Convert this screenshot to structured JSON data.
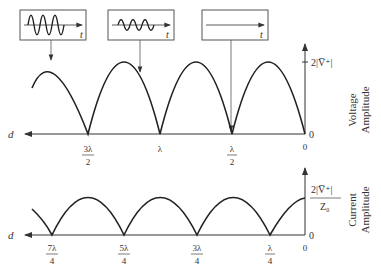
{
  "voltage_plot": {
    "axis_label_d": "d",
    "y_tick_max": "2|V̅⁺|",
    "y_tick_zero": "0",
    "y_title_line1": "Voltage",
    "y_title_line2": "Amplitude",
    "x_ticks": [
      {
        "num": "3λ",
        "den": "2"
      },
      {
        "num": "λ",
        "den": ""
      },
      {
        "num": "λ",
        "den": "2"
      },
      {
        "num": "0",
        "den": ""
      }
    ]
  },
  "current_plot": {
    "axis_label_d": "d",
    "y_tick_max_num": "2|V̅⁺|",
    "y_tick_max_den": "Z₀",
    "y_tick_zero": "0",
    "y_title_line1": "Current",
    "y_title_line2": "Amplitude",
    "x_ticks": [
      {
        "num": "7λ",
        "den": "4"
      },
      {
        "num": "5λ",
        "den": "4"
      },
      {
        "num": "3λ",
        "den": "4"
      },
      {
        "num": "λ",
        "den": "4"
      },
      {
        "num": "0",
        "den": ""
      }
    ]
  },
  "insets": [
    {
      "label": "t",
      "description": "large amplitude oscillation"
    },
    {
      "label": "t",
      "description": "medium amplitude oscillation"
    },
    {
      "label": "t",
      "description": "zero amplitude (flat)"
    }
  ]
}
